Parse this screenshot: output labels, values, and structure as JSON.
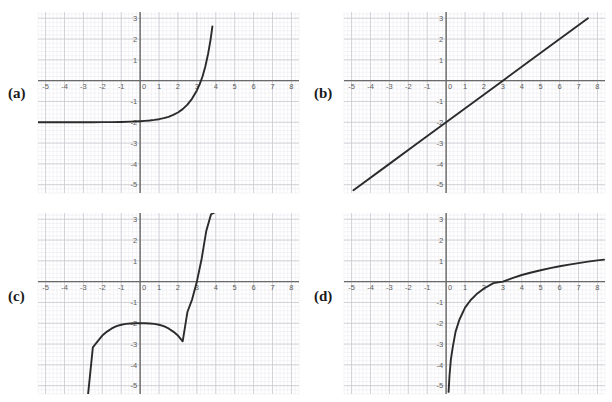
{
  "figure": {
    "title": "",
    "panel_count": 4,
    "background_color": "#ffffff",
    "curve_color": "#2b2b2b",
    "axis_color": "#6a6a6a",
    "major_grid_color": "#c9c9cf",
    "minor_grid_color": "#e9e9ef",
    "tick_label_color": "#5c5c5c"
  },
  "axes": {
    "x_ticks": [
      "-5",
      "-4",
      "-3",
      "-2",
      "-1",
      "0",
      "1",
      "2",
      "3",
      "4",
      "5",
      "6",
      "7",
      "8"
    ],
    "y_ticks": [
      "3",
      "2",
      "1",
      "0",
      "-1",
      "-2",
      "-3",
      "-4",
      "-5"
    ],
    "xlim": [
      -5.4,
      8.4
    ],
    "ylim": [
      -5.4,
      3.3
    ],
    "grid": true,
    "minor_per_major": 5
  },
  "panels": [
    {
      "id": "a",
      "label": "(a)",
      "chart_data": {
        "type": "line",
        "title": "",
        "xlabel": "",
        "ylabel": "",
        "curve_kind": "exponential",
        "description": "Exponential curve with horizontal asymptote y = -2, rising steeply, crossing the x-axis near x = 3",
        "asymptote": {
          "type": "horizontal",
          "value": -2
        },
        "x_intercept": 3,
        "y_intercept": -2,
        "xlim": [
          -5.4,
          8.4
        ],
        "ylim": [
          -5.4,
          3.3
        ],
        "x": [
          -5.4,
          -5.0,
          -4.5,
          -4.0,
          -3.5,
          -3.0,
          -2.5,
          -2.0,
          -1.5,
          -1.0,
          -0.5,
          0.0,
          0.25,
          0.5,
          0.75,
          1.0,
          1.25,
          1.5,
          1.75,
          2.0,
          2.25,
          2.5,
          2.75,
          3.0,
          3.15,
          3.3,
          3.45,
          3.6,
          3.72,
          3.82
        ],
        "y": [
          -2.0,
          -2.0,
          -2.0,
          -2.0,
          -2.0,
          -1.999,
          -1.998,
          -1.995,
          -1.991,
          -1.984,
          -1.971,
          -1.95,
          -1.935,
          -1.915,
          -1.888,
          -1.852,
          -1.803,
          -1.737,
          -1.649,
          -1.529,
          -1.368,
          -1.151,
          -0.86,
          -0.47,
          -0.17,
          0.2,
          0.69,
          1.32,
          1.95,
          2.6
        ]
      }
    },
    {
      "id": "b",
      "label": "(b)",
      "chart_data": {
        "type": "line",
        "title": "",
        "xlabel": "",
        "ylabel": "",
        "curve_kind": "linear",
        "description": "Straight line of slope 2/3 passing through (0, -2) and (3, 0)",
        "slope": 0.6667,
        "x_intercept": 3,
        "y_intercept": -2,
        "xlim": [
          -5.4,
          8.4
        ],
        "ylim": [
          -5.4,
          3.3
        ],
        "x": [
          -4.9,
          -3.0,
          -1.5,
          0.0,
          1.5,
          3.0,
          4.5,
          6.0,
          7.5
        ],
        "y": [
          -5.27,
          -4.0,
          -3.0,
          -2.0,
          -1.0,
          0.0,
          1.0,
          2.0,
          3.0
        ]
      }
    },
    {
      "id": "c",
      "label": "(c)",
      "chart_data": {
        "type": "line",
        "title": "",
        "xlabel": "",
        "ylabel": "",
        "curve_kind": "cubic",
        "description": "Cubic curve with inflection point at (0, -2), flattening near the origin and crossing the x-axis near x = 3",
        "inflection_point": [
          0,
          -2
        ],
        "x_intercept": 3,
        "y_intercept": -2,
        "xlim": [
          -5.4,
          8.4
        ],
        "ylim": [
          -5.4,
          3.3
        ],
        "x": [
          -2.75,
          -2.5,
          -2.25,
          -2.0,
          -1.75,
          -1.5,
          -1.25,
          -1.0,
          -0.75,
          -0.5,
          -0.25,
          0.0,
          0.25,
          0.5,
          0.75,
          1.0,
          1.25,
          1.5,
          1.75,
          2.0,
          2.25,
          2.5,
          2.75,
          3.0,
          3.25,
          3.5,
          3.75,
          3.9
        ],
        "y": [
          -5.39,
          -3.16,
          -2.87,
          -2.59,
          -2.4,
          -2.25,
          -2.14,
          -2.07,
          -2.03,
          -2.01,
          -2.0,
          -2.0,
          -2.0,
          -2.01,
          -2.03,
          -2.07,
          -2.14,
          -2.25,
          -2.4,
          -2.59,
          -2.87,
          -1.46,
          -0.85,
          0.0,
          1.09,
          2.45,
          3.24,
          3.3
        ]
      }
    },
    {
      "id": "d",
      "label": "(d)",
      "chart_data": {
        "type": "line",
        "title": "",
        "xlabel": "",
        "ylabel": "",
        "curve_kind": "logarithmic",
        "description": "Logarithmic curve with vertical asymptote at x = 0, rising slowly, crossing the x-axis near x = 3",
        "asymptote": {
          "type": "vertical",
          "value": 0
        },
        "x_intercept": 3,
        "xlim": [
          -5.4,
          8.4
        ],
        "ylim": [
          -5.4,
          3.3
        ],
        "x": [
          0.13,
          0.18,
          0.25,
          0.35,
          0.5,
          0.7,
          1.0,
          1.3,
          1.6,
          2.0,
          2.5,
          3.0,
          3.5,
          4.0,
          4.5,
          5.0,
          5.5,
          6.0,
          6.5,
          7.0,
          7.5,
          8.0,
          8.35
        ],
        "y": [
          -5.3,
          -4.5,
          -3.75,
          -3.15,
          -2.4,
          -1.83,
          -1.25,
          -0.88,
          -0.61,
          -0.33,
          -0.07,
          0.0,
          0.17,
          0.32,
          0.44,
          0.55,
          0.65,
          0.74,
          0.82,
          0.89,
          0.96,
          1.02,
          1.06
        ]
      }
    }
  ]
}
